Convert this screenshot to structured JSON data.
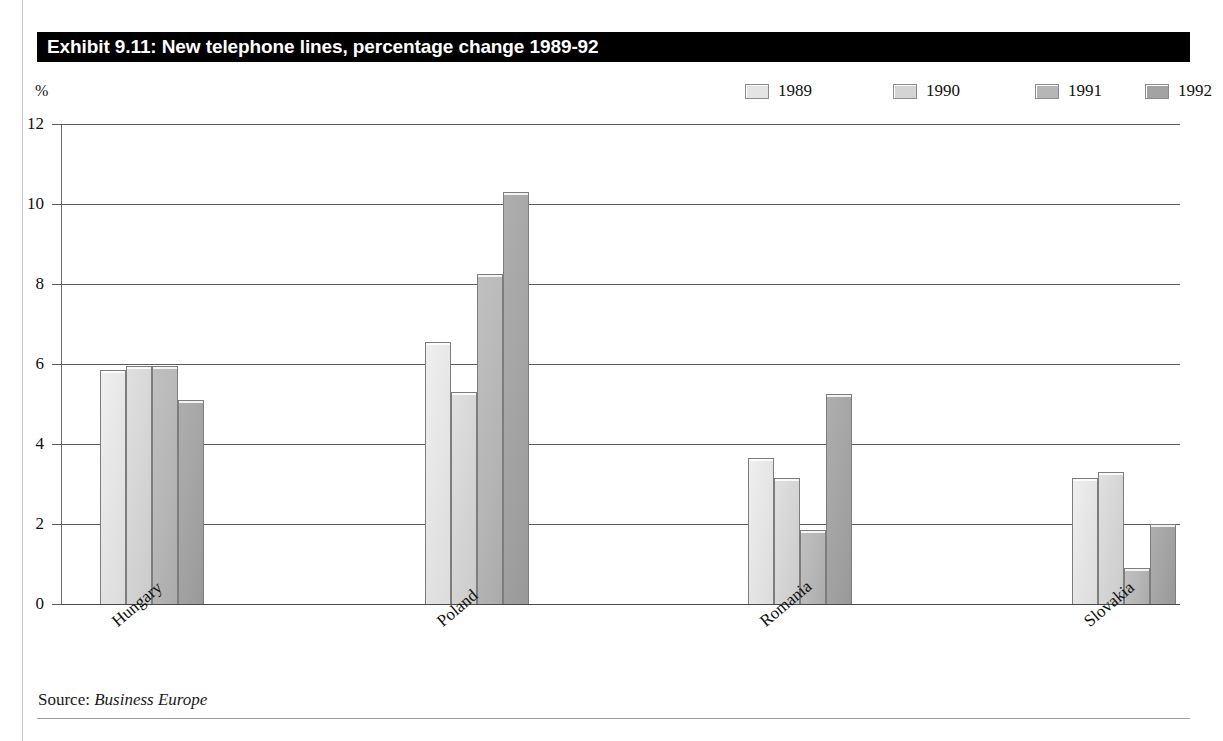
{
  "exhibit": {
    "title": "Exhibit 9.11: New telephone lines, percentage change 1989-92",
    "axis_unit_label": "%",
    "source_prefix": "Source:",
    "source_name": "Business Europe"
  },
  "legend": {
    "items": [
      {
        "label": "1989",
        "color": "#e4e4e4"
      },
      {
        "label": "1990",
        "color": "#d4d4d4"
      },
      {
        "label": "1991",
        "color": "#b6b6b6"
      },
      {
        "label": "1992",
        "color": "#a3a3a3"
      }
    ]
  },
  "chart_data": {
    "type": "bar",
    "title": "Exhibit 9.11: New telephone lines, percentage change 1989-92",
    "xlabel": "",
    "ylabel": "%",
    "ylim": [
      0,
      12
    ],
    "yticks": [
      "0",
      "2",
      "4",
      "6",
      "8",
      "10",
      "12"
    ],
    "grid": true,
    "legend_position": "top-right",
    "categories": [
      "Hungary",
      "Poland",
      "Romania",
      "Slovakia"
    ],
    "series": [
      {
        "name": "1989",
        "color": "#e4e4e4",
        "values": [
          5.85,
          6.55,
          3.65,
          3.15
        ]
      },
      {
        "name": "1990",
        "color": "#d4d4d4",
        "values": [
          5.95,
          5.3,
          3.15,
          3.3
        ]
      },
      {
        "name": "1991",
        "color": "#b6b6b6",
        "values": [
          5.95,
          8.25,
          1.85,
          0.9
        ]
      },
      {
        "name": "1992",
        "color": "#a3a3a3",
        "values": [
          5.1,
          10.3,
          5.25,
          2.0
        ]
      }
    ]
  }
}
